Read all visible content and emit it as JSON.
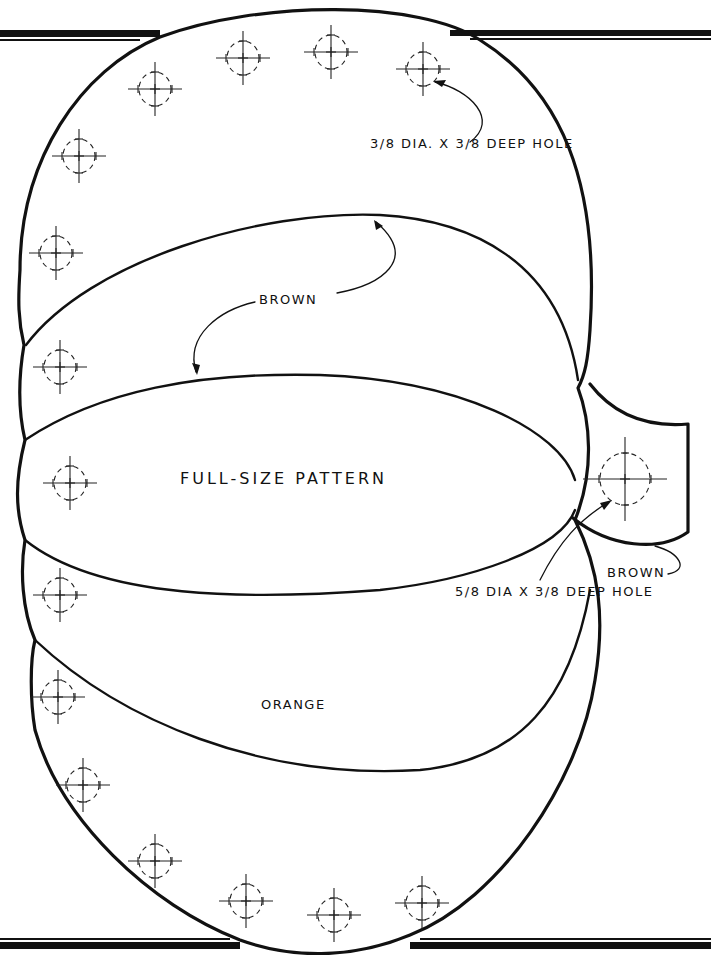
{
  "page": {
    "type": "woodworking full-size pattern"
  },
  "labels": {
    "title": "FULL-SIZE PATTERN",
    "top_color": "BROWN",
    "stem_color": "BROWN",
    "body_color": "ORANGE",
    "small_hole_note": {
      "line1": "3/8 DIA. X",
      "line2": "3/8 DEEP HOLE"
    },
    "stem_hole_note": {
      "line1": "5/8 DIA X 3/8",
      "line2": "DEEP HOLE"
    }
  },
  "colors": {
    "line": "#111111",
    "background": "#ffffff"
  },
  "holes": {
    "small_diameter": "3/8",
    "small_depth": "3/8",
    "large_diameter": "5/8",
    "large_depth": "3/8",
    "positions": [
      {
        "x": 155,
        "y": 89
      },
      {
        "x": 243,
        "y": 58
      },
      {
        "x": 331,
        "y": 52
      },
      {
        "x": 423,
        "y": 69
      },
      {
        "x": 79,
        "y": 156
      },
      {
        "x": 56,
        "y": 253
      },
      {
        "x": 60,
        "y": 367
      },
      {
        "x": 70,
        "y": 483
      },
      {
        "x": 60,
        "y": 595
      },
      {
        "x": 58,
        "y": 697
      },
      {
        "x": 83,
        "y": 785
      },
      {
        "x": 155,
        "y": 861
      },
      {
        "x": 246,
        "y": 901
      },
      {
        "x": 334,
        "y": 915
      },
      {
        "x": 422,
        "y": 903
      }
    ],
    "stem_hole": {
      "x": 625,
      "y": 479
    }
  }
}
